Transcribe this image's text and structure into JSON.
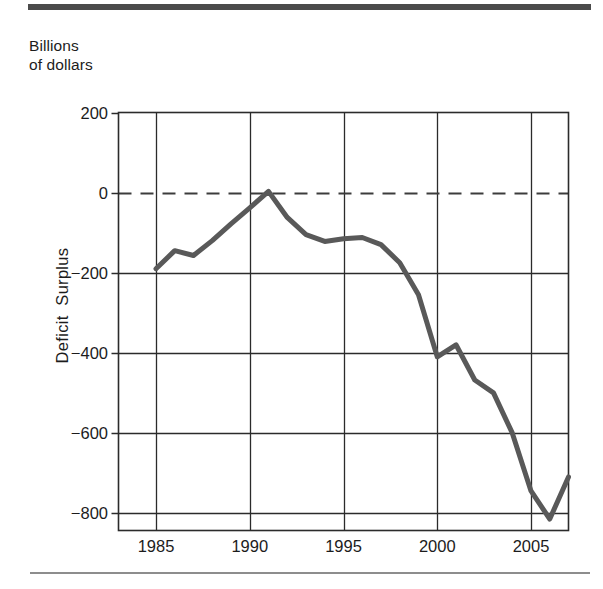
{
  "figure": {
    "units_caption": "Billions\nof dollars",
    "top_rule_color": "#4b4b4b",
    "bottom_rule_color": "#8d8d8d"
  },
  "chart_data": {
    "type": "line",
    "title": "",
    "subtitle": "",
    "units_label": "Billions of dollars",
    "xlabel": "",
    "ylabel": "Deficit  Surplus",
    "xlim": [
      1983,
      2007
    ],
    "ylim": [
      -900,
      200
    ],
    "xticks": [
      1985,
      1990,
      1995,
      2000,
      2005
    ],
    "xticklabels": [
      "1985",
      "1990",
      "1995",
      "2000",
      "2005"
    ],
    "yticks": [
      200,
      0,
      -200,
      -400,
      -600,
      -800
    ],
    "yticklabels": [
      "200",
      "0",
      "−200",
      "−400",
      "−600",
      "−800"
    ],
    "grid": true,
    "grid_vertical_at": [
      1985,
      1990,
      1995,
      2000,
      2005
    ],
    "grid_horizontal_at": [
      -200,
      -400,
      -600,
      -800
    ],
    "zero_line": {
      "value": 0,
      "style": "dashed",
      "color": "#3c3c3c"
    },
    "legend": null,
    "line_color": "#595959",
    "line_width": 5,
    "x": [
      1985,
      1986,
      1987,
      1988,
      1989,
      1990,
      1991,
      1992,
      1993,
      1994,
      1995,
      1996,
      1997,
      1998,
      1999,
      2000,
      2001,
      2002,
      2003,
      2004,
      2005,
      2006,
      2007
    ],
    "values": [
      -190,
      -145,
      -157,
      -120,
      -78,
      -38,
      3,
      -62,
      -105,
      -122,
      -115,
      -112,
      -130,
      -175,
      -255,
      -410,
      -380,
      -468,
      -500,
      -600,
      -745,
      -815,
      -710
    ],
    "series": [
      {
        "name": "Deficit / Surplus",
        "values": [
          -190,
          -145,
          -157,
          -120,
          -78,
          -38,
          3,
          -62,
          -105,
          -122,
          -115,
          -112,
          -130,
          -175,
          -255,
          -410,
          -380,
          -468,
          -500,
          -600,
          -745,
          -815,
          -710
        ]
      }
    ]
  },
  "axis_labels": {
    "y": [
      {
        "value": 200,
        "text": "200"
      },
      {
        "value": 0,
        "text": "0"
      },
      {
        "value": -200,
        "text": "−200"
      },
      {
        "value": -400,
        "text": "−400"
      },
      {
        "value": -600,
        "text": "−600"
      },
      {
        "value": -800,
        "text": "−800"
      }
    ],
    "x": [
      {
        "value": 1985,
        "text": "1985"
      },
      {
        "value": 1990,
        "text": "1990"
      },
      {
        "value": 1995,
        "text": "1995"
      },
      {
        "value": 2000,
        "text": "2000"
      },
      {
        "value": 2005,
        "text": "2005"
      }
    ]
  }
}
